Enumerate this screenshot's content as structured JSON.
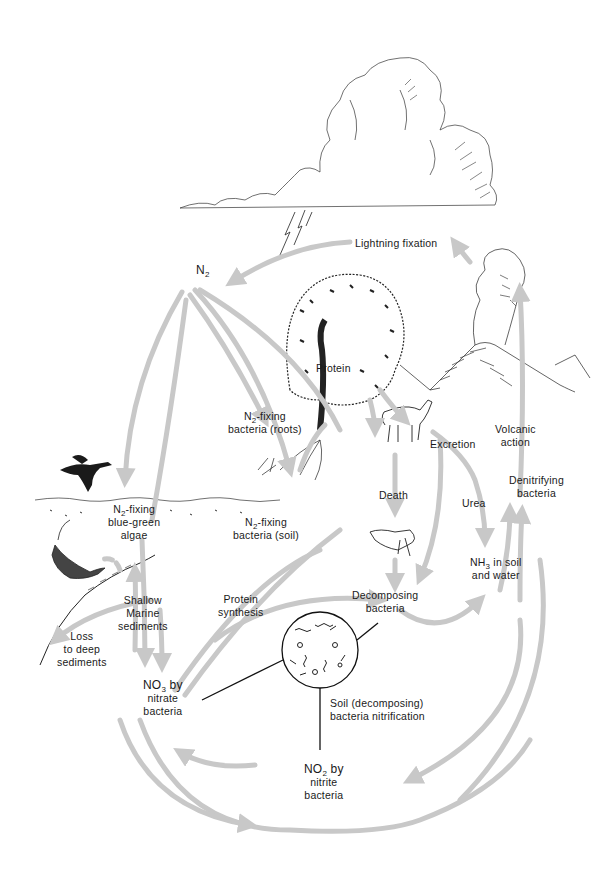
{
  "diagram": {
    "arrow_color": "#c8c8c8",
    "ink_color": "#1a1a1a",
    "labels": {
      "lightning": "Lightning fixation",
      "n2_main": "N",
      "n2_main_sub": "2",
      "protein": "Protein",
      "n2_fix_roots_1_pre": "N",
      "n2_fix_roots_1_sub": "2",
      "n2_fix_roots_1_post": "-fixing",
      "n2_fix_roots_2": "bacteria (roots)",
      "excretion": "Excretion",
      "volcanic_1": "Volcanic",
      "volcanic_2": "action",
      "denitrifying_1": "Denitrifying",
      "denitrifying_2": "bacteria",
      "death": "Death",
      "urea": "Urea",
      "algae_1_pre": "N",
      "algae_1_sub": "2",
      "algae_1_post": "-fixing",
      "algae_2": "blue-green",
      "algae_3": "algae",
      "n2_fix_soil_1_pre": "N",
      "n2_fix_soil_1_sub": "2",
      "n2_fix_soil_1_post": "-fixing",
      "n2_fix_soil_2": "bacteria (soil)",
      "nh3_1_pre": "NH",
      "nh3_1_sub": "3",
      "nh3_1_post": " in soil",
      "nh3_2": "and water",
      "shallow_1": "Shallow",
      "shallow_2": "Marine",
      "shallow_3": "sediments",
      "protein_syn_1": "Protein",
      "protein_syn_2": "synthesis",
      "decomposing_1": "Decomposing",
      "decomposing_2": "bacteria",
      "loss_1": "Loss",
      "loss_2": "to deep",
      "loss_3": "sediments",
      "no3_1_pre": "NO",
      "no3_1_sub": "3",
      "no3_1_post": " by",
      "no3_2": "nitrate",
      "no3_3": "bacteria",
      "soil_nitr_1": "Soil (decomposing)",
      "soil_nitr_2": "bacteria nitrification",
      "no2_1_pre": "NO",
      "no2_1_sub": "2",
      "no2_1_post": " by",
      "no2_2": "nitrite",
      "no2_3": "bacteria"
    },
    "illustrations": [
      "cloud-icon",
      "lightning-icon",
      "tree-icon",
      "volcano-icon",
      "deer-icon",
      "bird-icon",
      "fish-icon",
      "dead-animal-icon",
      "bacteria-microscope-icon",
      "roots-icon"
    ]
  }
}
